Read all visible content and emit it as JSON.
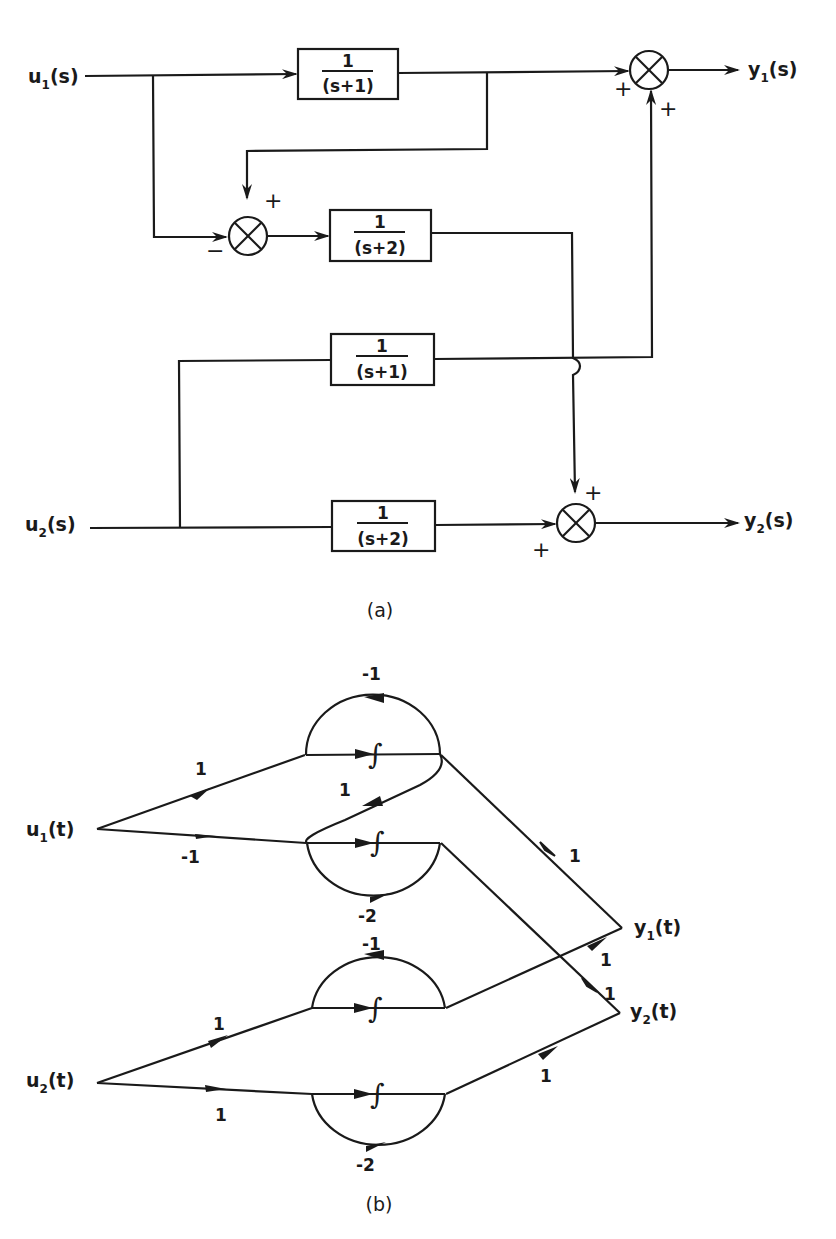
{
  "figure_a": {
    "caption": "(a)",
    "inputs": [
      {
        "name": "u",
        "sub": "1",
        "arg": "(s)"
      },
      {
        "name": "u",
        "sub": "2",
        "arg": "(s)"
      }
    ],
    "outputs": [
      {
        "name": "y",
        "sub": "1",
        "arg": "(s)"
      },
      {
        "name": "y",
        "sub": "2",
        "arg": "(s)"
      }
    ],
    "blocks": [
      {
        "num": "1",
        "den": "(s+1)"
      },
      {
        "num": "1",
        "den": "(s+2)"
      },
      {
        "num": "1",
        "den": "(s+1)"
      },
      {
        "num": "1",
        "den": "(s+2)"
      }
    ],
    "summers": [
      {
        "signs": [
          "+",
          "+"
        ]
      },
      {
        "signs": [
          "+",
          "−"
        ]
      },
      {
        "signs": [
          "+",
          "+"
        ]
      }
    ]
  },
  "figure_b": {
    "caption": "(b)",
    "inputs": [
      {
        "name": "u",
        "sub": "1",
        "arg": "(t)"
      },
      {
        "name": "u",
        "sub": "2",
        "arg": "(t)"
      }
    ],
    "outputs": [
      {
        "name": "y",
        "sub": "1",
        "arg": "(t)"
      },
      {
        "name": "y",
        "sub": "2",
        "arg": "(t)"
      }
    ],
    "integrator_symbol": "∫",
    "gains": {
      "u1_top": "1",
      "u1_bottom": "-1",
      "loop1": "-1",
      "loop2": "-2",
      "cross": "1",
      "to_y1_from_x1": "1",
      "to_y1_from_x3": "1",
      "to_y2_from_x2": "1",
      "to_y2_from_x4": "1",
      "u2_top": "1",
      "u2_bottom": "1",
      "loop3": "-1",
      "loop4": "-2"
    }
  }
}
